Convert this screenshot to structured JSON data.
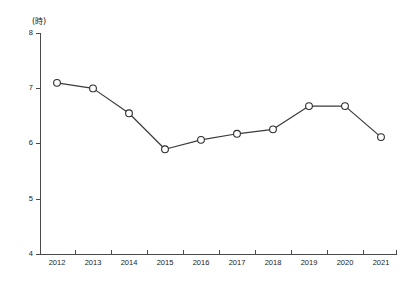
{
  "chart_data": {
    "type": "line",
    "title": "",
    "subtitle": "",
    "xlabel": "",
    "ylabel": "",
    "unit_label": "(時)",
    "categories": [
      "2012",
      "2013",
      "2014",
      "2015",
      "2016",
      "2017",
      "2018",
      "2019",
      "2020",
      "2021"
    ],
    "values": [
      7.1,
      7.0,
      6.55,
      5.9,
      6.07,
      6.18,
      6.26,
      6.68,
      6.68,
      6.12
    ],
    "series": [
      {
        "name": "",
        "values": [
          7.1,
          7.0,
          6.55,
          5.9,
          6.07,
          6.18,
          6.26,
          6.68,
          6.68,
          6.12
        ]
      }
    ],
    "ylim": [
      4,
      8
    ],
    "xlim": [
      "2012",
      "2021"
    ],
    "ytick_labels": [
      "8",
      "7",
      "6",
      "5",
      "4"
    ],
    "ytick_values": [
      8,
      7,
      6,
      5,
      4
    ],
    "xtick_labels": [
      "2012",
      "2013",
      "2014",
      "2015",
      "2016",
      "2017",
      "2018",
      "2019",
      "2020",
      "2021"
    ],
    "grid": false,
    "legend": false,
    "legend_position": "none",
    "marker": "open-circle",
    "line_color": "#3a3a3a",
    "marker_fill": "#ffffff",
    "marker_stroke": "#2e2e2e",
    "axis_color": "#4a4a4a",
    "background_color": "#ffffff"
  },
  "axis": {
    "unit": "(時)",
    "y_labels": {
      "t0": "8",
      "t1": "7",
      "t2": "6",
      "t3": "5",
      "t4": "4"
    },
    "x_labels": {
      "c0": "2012",
      "c1": "2013",
      "c2": "2014",
      "c3": "2015",
      "c4": "2016",
      "c5": "2017",
      "c6": "2018",
      "c7": "2019",
      "c8": "2020",
      "c9": "2021"
    }
  }
}
